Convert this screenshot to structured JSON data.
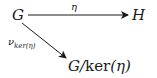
{
  "diagram": {
    "type": "commutative-diagram",
    "nodes": {
      "G": "G",
      "H": "H",
      "quotient_main": "G/",
      "quotient_ker": "ker",
      "quotient_arg": "(η)"
    },
    "edges": {
      "top_label": "η",
      "diag_label_main": "ν",
      "diag_label_sub": "ker(η)"
    },
    "edge_list": [
      {
        "from": "G",
        "to": "H",
        "label": "η"
      },
      {
        "from": "G",
        "to": "G/ker(η)",
        "label": "ν_ker(η)"
      }
    ]
  }
}
